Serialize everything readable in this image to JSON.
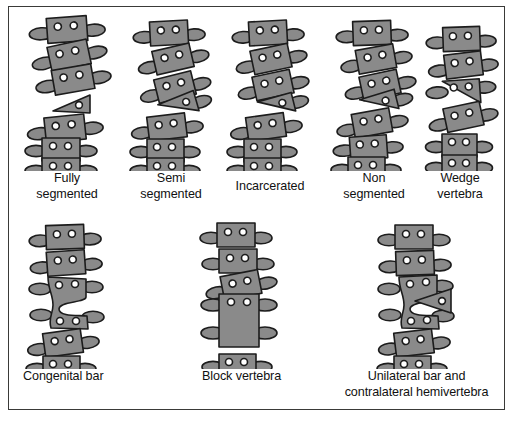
{
  "figure": {
    "background_color": "#ffffff",
    "border_color": "#3a3a38",
    "bone_fill_color": "#8a8a8a",
    "bone_outline_color": "#1c1c1c",
    "pedicle_fill_color": "#ffffff",
    "label_color": "#111111"
  },
  "rows": [
    {
      "name": "hemivertebra-types",
      "items": [
        {
          "id": "fully-segmented",
          "label": "Fully\nsegmented",
          "label_lines": [
            "Fully",
            "segmented"
          ],
          "description": "Hemivertebra separated from the vertebrae above and below by normal disc spaces",
          "vertebra_count": 6,
          "anomaly": "free triangular hemivertebra"
        },
        {
          "id": "semi-segmented",
          "label": "Semi\nsegmented",
          "label_lines": [
            "Semi",
            "segmented"
          ],
          "description": "Hemivertebra fused to the adjacent vertebra on one side only",
          "vertebra_count": 6,
          "anomaly": "wedge fused superiorly"
        },
        {
          "id": "incarcerated",
          "label": "Incarcerated",
          "label_lines": [
            "Incarcerated"
          ],
          "description": "Hemivertebra tucked into a notch of the adjacent vertebrae with preserved alignment",
          "vertebra_count": 6,
          "anomaly": "recessed wedge"
        },
        {
          "id": "non-segmented",
          "label": "Non\nsegmented",
          "label_lines": [
            "Non",
            "segmented"
          ],
          "description": "Hemivertebra fused to the vertebrae both above and below",
          "vertebra_count": 6,
          "anomaly": "wedge fused on both sides"
        },
        {
          "id": "wedge-vertebra",
          "label": "Wedge\nvertebra",
          "label_lines": [
            "Wedge",
            "vertebra"
          ],
          "description": "Vertebral body tapering to one side without a separate hemivertebra",
          "vertebra_count": 6,
          "anomaly": "trapezoidal body"
        }
      ]
    },
    {
      "name": "segmentation-failures",
      "items": [
        {
          "id": "congenital-bar",
          "label": "Congenital bar",
          "label_lines": [
            "Congenital bar"
          ],
          "description": "Unsegmented bony bar bridging two vertebrae on one side",
          "vertebra_count": 5,
          "anomaly": "unilateral bar"
        },
        {
          "id": "block-vertebra",
          "label": "Block vertebra",
          "label_lines": [
            "Block vertebra"
          ],
          "description": "Two vertebrae completely fused into a single tall block",
          "vertebra_count": 5,
          "anomaly": "full fusion block"
        },
        {
          "id": "unilateral-bar-contralateral-hemivertebra",
          "label": "Unilateral bar and\ncontralateral hemivertebra",
          "label_lines": [
            "Unilateral bar and",
            "contralateral hemivertebra"
          ],
          "description": "Unsegmented bar on one side combined with a hemivertebra on the opposite side",
          "vertebra_count": 5,
          "anomaly": "bar plus opposite hemivertebra"
        }
      ]
    }
  ]
}
